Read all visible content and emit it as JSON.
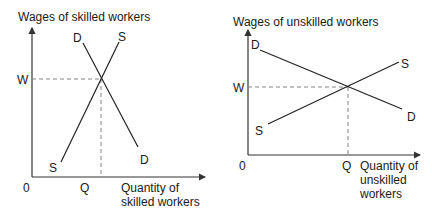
{
  "panels": [
    {
      "id": "skilled",
      "y_axis_label": "Wages of skilled workers",
      "x_axis_label_line1": "Quantity of",
      "x_axis_label_line2": "skilled workers",
      "origin_label": "0",
      "wage_label": "W",
      "quantity_label": "Q",
      "demand_top_label": "D",
      "demand_bottom_label": "D",
      "supply_top_label": "S",
      "supply_bottom_label": "S"
    },
    {
      "id": "unskilled",
      "y_axis_label": "Wages of unskilled workers",
      "x_axis_label_line1": "Quantity of",
      "x_axis_label_line2": "unskilled",
      "x_axis_label_line3": "workers",
      "origin_label": "0",
      "wage_label": "W",
      "quantity_label": "Q",
      "demand_top_label": "D",
      "demand_bottom_label": "D",
      "supply_top_label": "S",
      "supply_bottom_label": "S"
    }
  ]
}
